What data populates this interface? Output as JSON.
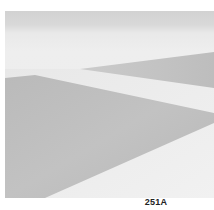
{
  "figure": {
    "caption": "251A",
    "colors": {
      "sky_band": "#d4d4d4",
      "light_surface": "#ececec",
      "large_shadow": "#bdbdbd",
      "wedge_shadow": "#c2c2c2"
    }
  }
}
